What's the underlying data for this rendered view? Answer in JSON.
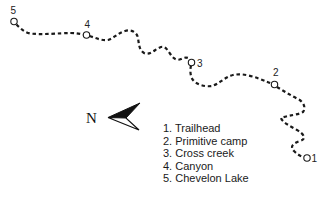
{
  "map": {
    "title": "Trail route map",
    "trail_color": "#1a1a1a",
    "waypoints": [
      {
        "num": "1",
        "name": "Trailhead"
      },
      {
        "num": "2",
        "name": "Primitive camp"
      },
      {
        "num": "3",
        "name": "Cross creek"
      },
      {
        "num": "4",
        "name": "Canyon"
      },
      {
        "num": "5",
        "name": "Chevelon Lake"
      }
    ],
    "compass": {
      "label": "N",
      "icon": "north-arrow-icon"
    }
  },
  "legend": {
    "items": [
      "1. Trailhead",
      "2. Primitive camp",
      "3. Cross creek",
      "4. Canyon",
      "5. Chevelon Lake"
    ]
  }
}
